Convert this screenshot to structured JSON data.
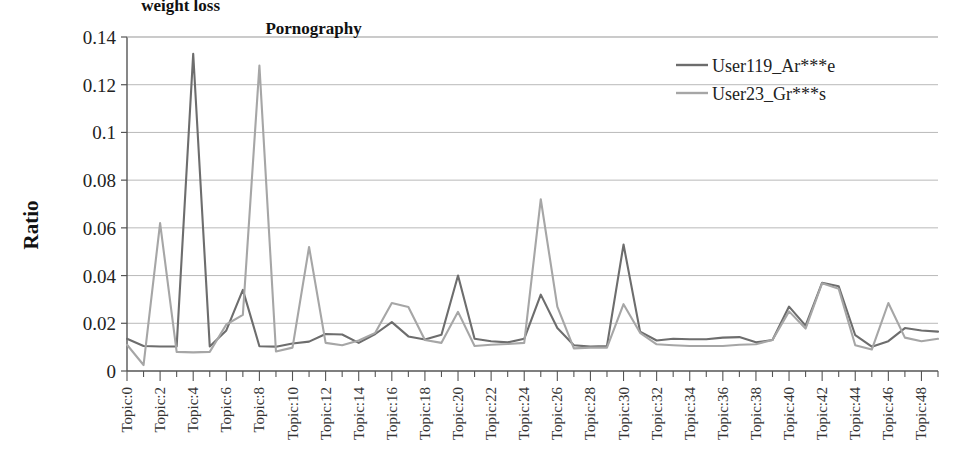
{
  "chart_data": {
    "type": "line",
    "title": "",
    "xlabel": "",
    "ylabel": "Ratio",
    "ylim": [
      0,
      0.14
    ],
    "ytick_values": [
      0,
      0.02,
      0.04,
      0.06,
      0.08,
      0.1,
      0.12,
      0.14
    ],
    "ytick_labels": [
      "0",
      "0.02",
      "0.04",
      "0.06",
      "0.08",
      "0.1",
      "0.12",
      "0.14"
    ],
    "grid": true,
    "legend_position": "top-right",
    "x_prefix": "Topic:",
    "x_indices": [
      0,
      1,
      2,
      3,
      4,
      5,
      6,
      7,
      8,
      9,
      10,
      11,
      12,
      13,
      14,
      15,
      16,
      17,
      18,
      19,
      20,
      21,
      22,
      23,
      24,
      25,
      26,
      27,
      28,
      29,
      30,
      31,
      32,
      33,
      34,
      35,
      36,
      37,
      38,
      39,
      40,
      41,
      42,
      43,
      44,
      45,
      46,
      47,
      48,
      49
    ],
    "categories": [
      "Topic:0",
      "Topic:1",
      "Topic:2",
      "Topic:3",
      "Topic:4",
      "Topic:5",
      "Topic:6",
      "Topic:7",
      "Topic:8",
      "Topic:9",
      "Topic:10",
      "Topic:11",
      "Topic:12",
      "Topic:13",
      "Topic:14",
      "Topic:15",
      "Topic:16",
      "Topic:17",
      "Topic:18",
      "Topic:19",
      "Topic:20",
      "Topic:21",
      "Topic:22",
      "Topic:23",
      "Topic:24",
      "Topic:25",
      "Topic:26",
      "Topic:27",
      "Topic:28",
      "Topic:29",
      "Topic:30",
      "Topic:31",
      "Topic:32",
      "Topic:33",
      "Topic:34",
      "Topic:35",
      "Topic:36",
      "Topic:37",
      "Topic:38",
      "Topic:39",
      "Topic:40",
      "Topic:41",
      "Topic:42",
      "Topic:43",
      "Topic:44",
      "Topic:45",
      "Topic:46",
      "Topic:47",
      "Topic:48",
      "Topic:49"
    ],
    "xtick_labels_shown": [
      "Topic:0",
      "Topic:2",
      "Topic:4",
      "Topic:6",
      "Topic:8",
      "Topic:10",
      "Topic:12",
      "Topic:14",
      "Topic:16",
      "Topic:18",
      "Topic:20",
      "Topic:22",
      "Topic:24",
      "Topic:26",
      "Topic:28",
      "Topic:30",
      "Topic:32",
      "Topic:34",
      "Topic:36",
      "Topic:38",
      "Topic:40",
      "Topic:42",
      "Topic:44",
      "Topic:46",
      "Topic:48"
    ],
    "series": [
      {
        "name": "User119_Ar***e",
        "color": "#6d6d6d",
        "values": [
          0.0135,
          0.0105,
          0.0103,
          0.0103,
          0.133,
          0.0103,
          0.017,
          0.034,
          0.0104,
          0.0102,
          0.0115,
          0.0123,
          0.0155,
          0.0153,
          0.0118,
          0.0155,
          0.0205,
          0.0145,
          0.0132,
          0.0152,
          0.04,
          0.0135,
          0.0125,
          0.012,
          0.0135,
          0.032,
          0.018,
          0.0108,
          0.0102,
          0.0105,
          0.053,
          0.0165,
          0.0128,
          0.0135,
          0.0133,
          0.0133,
          0.014,
          0.0142,
          0.012,
          0.013,
          0.027,
          0.019,
          0.037,
          0.0355,
          0.015,
          0.0102,
          0.0125,
          0.018,
          0.017,
          0.0165
        ]
      },
      {
        "name": "User23_Gr***s",
        "color": "#a6a6a6",
        "values": [
          0.011,
          0.0025,
          0.062,
          0.008,
          0.0078,
          0.008,
          0.0195,
          0.0235,
          0.128,
          0.0082,
          0.0098,
          0.052,
          0.0118,
          0.0108,
          0.0128,
          0.016,
          0.0285,
          0.0268,
          0.013,
          0.0118,
          0.0248,
          0.0105,
          0.011,
          0.0113,
          0.0118,
          0.072,
          0.027,
          0.0095,
          0.0098,
          0.0098,
          0.028,
          0.016,
          0.0112,
          0.0108,
          0.0105,
          0.0105,
          0.0105,
          0.011,
          0.0112,
          0.013,
          0.025,
          0.0178,
          0.0368,
          0.0345,
          0.0108,
          0.009,
          0.0285,
          0.014,
          0.0125,
          0.0135
        ]
      }
    ],
    "annotations": [
      {
        "text": "weight  loss",
        "x_index": 4,
        "y_value": 0.1335,
        "dx": -52,
        "dy": -42
      },
      {
        "text": "Pornography",
        "x_index": 8,
        "y_value": 0.128,
        "dx": 6,
        "dy": -32
      }
    ]
  }
}
